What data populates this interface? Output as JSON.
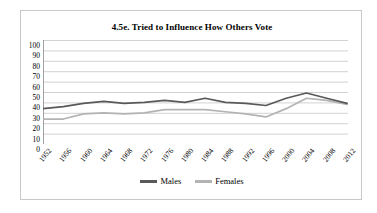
{
  "chart_data": {
    "type": "line",
    "title": "4.5e. Tried to Influence How Others Vote",
    "xlabel": "",
    "ylabel": "",
    "ylim": [
      0,
      100
    ],
    "ytick_step": 10,
    "yticks": [
      "100",
      "90",
      "80",
      "70",
      "60",
      "50",
      "40",
      "30",
      "20",
      "10",
      "0"
    ],
    "grid": true,
    "legend_position": "bottom",
    "categories": [
      "1952",
      "1956",
      "1960",
      "1964",
      "1968",
      "1972",
      "1976",
      "1980",
      "1984",
      "1988",
      "1992",
      "1996",
      "2000",
      "2004",
      "2008",
      "2012"
    ],
    "series": [
      {
        "name": "Males",
        "color": "#595959",
        "values": [
          34,
          36,
          39,
          41,
          39,
          40,
          42,
          40,
          44,
          40,
          39,
          37,
          44,
          49,
          44,
          39
        ]
      },
      {
        "name": "Females",
        "color": "#b3b3b3",
        "values": [
          24,
          24,
          29,
          30,
          29,
          30,
          33,
          33,
          33,
          31,
          29,
          26,
          34,
          44,
          42,
          38
        ]
      }
    ]
  },
  "legend": {
    "items": [
      {
        "label": "Males",
        "color": "#595959"
      },
      {
        "label": "Females",
        "color": "#b3b3b3"
      }
    ]
  },
  "colors": {
    "males": "#595959",
    "females": "#b3b3b3",
    "gridline": "#bfbfbf",
    "axis": "#8c8c8c",
    "border": "#c9c9c9",
    "background": "#ffffff"
  }
}
